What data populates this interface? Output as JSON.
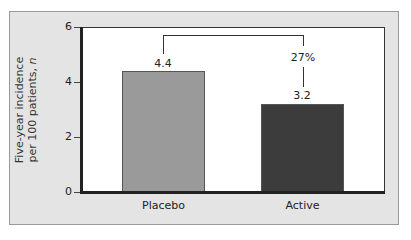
{
  "chart_data": {
    "type": "bar",
    "title": "",
    "xlabel": "",
    "ylabel": "Five-year incidence per 100 patients, n",
    "ylabel_lines": [
      "Five-year incidence",
      "per 100 patients, n"
    ],
    "categories": [
      "Placebo",
      "Active"
    ],
    "values": [
      4.4,
      3.2
    ],
    "value_labels": [
      "4.4",
      "3.2"
    ],
    "bar_colors": [
      "#9a9a9a",
      "#3c3c3c"
    ],
    "ylim": [
      0,
      6
    ],
    "yticks": [
      0,
      2,
      4,
      6
    ],
    "ytick_labels": [
      "0",
      "2",
      "4",
      "6"
    ],
    "grid": false,
    "legend": null,
    "annotations": [
      {
        "type": "bracket",
        "from": "Placebo",
        "to": "Active",
        "label": "27%",
        "meaning": "relative reduction"
      }
    ]
  },
  "colors": {
    "panel_background": "#e4e4e4",
    "plot_background": "#ffffff",
    "axis": "#222222"
  }
}
